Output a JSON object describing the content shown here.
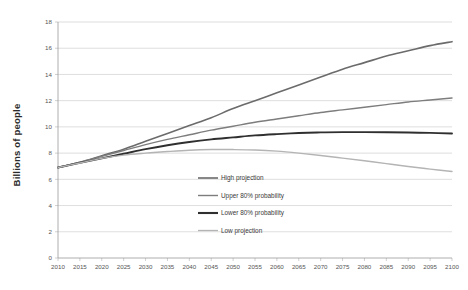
{
  "chart_data": {
    "type": "line",
    "title": "",
    "xlabel": "",
    "ylabel": "Billions of people",
    "ylim": [
      0,
      18
    ],
    "ytick_step": 2,
    "yticks": [
      "0",
      "2",
      "4",
      "6",
      "8",
      "10",
      "12",
      "14",
      "16",
      "18"
    ],
    "grid": true,
    "legend_position": "inside-center",
    "x": [
      2010,
      2015,
      2020,
      2025,
      2030,
      2035,
      2040,
      2045,
      2050,
      2055,
      2060,
      2065,
      2070,
      2075,
      2080,
      2085,
      2090,
      2095,
      2100
    ],
    "categories": [
      "2010",
      "2015",
      "2020",
      "2025",
      "2030",
      "2035",
      "2040",
      "2045",
      "2050",
      "2055",
      "2060",
      "2065",
      "2070",
      "2075",
      "2080",
      "2085",
      "2090",
      "2095",
      "2100"
    ],
    "series": [
      {
        "name": "High projection",
        "color": "#6b6b6b",
        "width": 1.6,
        "values": [
          6.9,
          7.3,
          7.8,
          8.3,
          8.9,
          9.5,
          10.1,
          10.7,
          11.4,
          12.0,
          12.6,
          13.2,
          13.8,
          14.4,
          14.9,
          15.4,
          15.8,
          16.2,
          16.5
        ]
      },
      {
        "name": "Upper 80% probability",
        "color": "#7d7d7d",
        "width": 1.4,
        "values": [
          6.9,
          7.3,
          7.75,
          8.2,
          8.65,
          9.05,
          9.4,
          9.75,
          10.05,
          10.35,
          10.6,
          10.85,
          11.1,
          11.3,
          11.5,
          11.7,
          11.9,
          12.05,
          12.2
        ]
      },
      {
        "name": "Lower 80% probability",
        "color": "#2f2f2f",
        "width": 1.9,
        "values": [
          6.9,
          7.25,
          7.6,
          7.95,
          8.3,
          8.6,
          8.85,
          9.05,
          9.2,
          9.35,
          9.45,
          9.53,
          9.58,
          9.6,
          9.6,
          9.59,
          9.57,
          9.54,
          9.5
        ]
      },
      {
        "name": "Low projection",
        "color": "#b4b4b4",
        "width": 1.4,
        "values": [
          6.9,
          7.25,
          7.6,
          7.85,
          8.0,
          8.12,
          8.22,
          8.27,
          8.27,
          8.24,
          8.15,
          8.0,
          7.82,
          7.62,
          7.42,
          7.2,
          6.98,
          6.78,
          6.6
        ]
      }
    ],
    "legend": [
      {
        "label": "High projection",
        "color": "#6b6b6b",
        "width": 1.6
      },
      {
        "label": "Upper 80% probability",
        "color": "#7d7d7d",
        "width": 1.4
      },
      {
        "label": "Lower 80% probability",
        "color": "#2f2f2f",
        "width": 2.1
      },
      {
        "label": "Low projection",
        "color": "#b4b4b4",
        "width": 1.3
      }
    ]
  }
}
